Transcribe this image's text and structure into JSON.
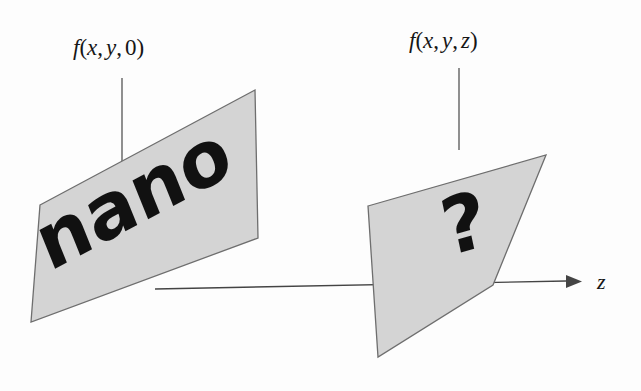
{
  "figure": {
    "title_visible": false,
    "background_color": "#fdfdfd",
    "plane_fill_color": "#d4d4d4",
    "plane_stroke_color": "#6e6e6e",
    "ink_color": "#111111"
  },
  "labels": {
    "left_plane_label": {
      "function_name": "f",
      "open_paren": "(",
      "arg_x": "x",
      "comma1": ",",
      "arg_y": "y",
      "comma2": ",",
      "arg_z": "0",
      "close_paren": ")",
      "full_text": "f(x, y, 0)"
    },
    "right_plane_label": {
      "function_name": "f",
      "open_paren": "(",
      "arg_x": "x",
      "comma1": ",",
      "arg_y": "y",
      "comma2": ",",
      "arg_z": "z",
      "close_paren": ")",
      "full_text": "f(x, y, z)"
    },
    "axis_label": "z"
  },
  "planes": {
    "left": {
      "content_text": "nano",
      "points": "40,205 255,90 258,238 31,322"
    },
    "right": {
      "content_text": "?",
      "points": "368,206 546,155 493,285 378,357"
    }
  },
  "axis": {
    "name": "z-axis",
    "direction": "right",
    "arrow_glyph": "→"
  }
}
